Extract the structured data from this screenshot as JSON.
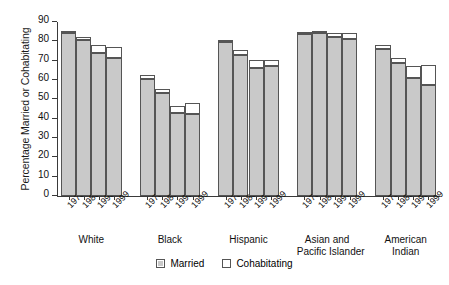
{
  "chart_data": {
    "type": "bar",
    "subtype": "stacked-grouped",
    "title": "",
    "xlabel": "",
    "ylabel": "Percentage Married or Cohabitating",
    "ylim": [
      0,
      90
    ],
    "ytick_step": 10,
    "yticks": [
      0,
      10,
      20,
      30,
      40,
      50,
      60,
      70,
      80,
      90
    ],
    "grid": false,
    "legend_position": "bottom-center",
    "categories": [
      "1970",
      "1980",
      "1990",
      "1999"
    ],
    "groups": [
      "White",
      "Black",
      "Hispanic",
      "Asian and Pacific Islander",
      "American Indian"
    ],
    "group_labels_wrapped": [
      [
        "White"
      ],
      [
        "Black"
      ],
      [
        "Hispanic"
      ],
      [
        "Asian and",
        "Pacific Islander"
      ],
      [
        "American",
        "Indian"
      ]
    ],
    "series": [
      {
        "name": "Married",
        "color": "#c9c9c9",
        "values_by_group": {
          "White": [
            84.5,
            80.5,
            74.0,
            71.5
          ],
          "Black": [
            60.5,
            53.5,
            43.0,
            42.5
          ],
          "Hispanic": [
            79.5,
            73.0,
            66.0,
            67.0
          ],
          "Asian and Pacific Islander": [
            84.0,
            84.5,
            82.0,
            81.0
          ],
          "American Indian": [
            76.0,
            69.0,
            61.0,
            57.5
          ]
        }
      },
      {
        "name": "Cohabitating",
        "color": "#ffffff",
        "values_by_group": {
          "White": [
            1.0,
            2.0,
            4.0,
            5.5
          ],
          "Black": [
            2.0,
            2.0,
            3.5,
            5.5
          ],
          "Hispanic": [
            0.5,
            2.5,
            4.5,
            3.5
          ],
          "Asian and Pacific Islander": [
            1.0,
            0.5,
            2.5,
            3.5
          ],
          "American Indian": [
            2.0,
            2.5,
            6.5,
            10.5
          ]
        }
      }
    ],
    "totals_by_group": {
      "White": [
        85.5,
        82.5,
        78.0,
        77.0
      ],
      "Black": [
        62.5,
        55.5,
        46.5,
        48.0
      ],
      "Hispanic": [
        80.0,
        75.5,
        70.5,
        70.5
      ],
      "Asian and Pacific Islander": [
        85.0,
        85.0,
        84.5,
        84.5
      ],
      "American Indian": [
        78.0,
        71.5,
        67.5,
        68.0
      ]
    },
    "legend": [
      {
        "label": "Married",
        "swatch": "filled-gray"
      },
      {
        "label": "Cohabitating",
        "swatch": "open-white"
      }
    ]
  },
  "colors": {
    "married_fill": "#c9c9c9",
    "cohabitating_fill": "#ffffff",
    "bar_stroke": "#555555",
    "axis": "#3a3a3a",
    "background": "#ffffff",
    "text": "#111111"
  }
}
